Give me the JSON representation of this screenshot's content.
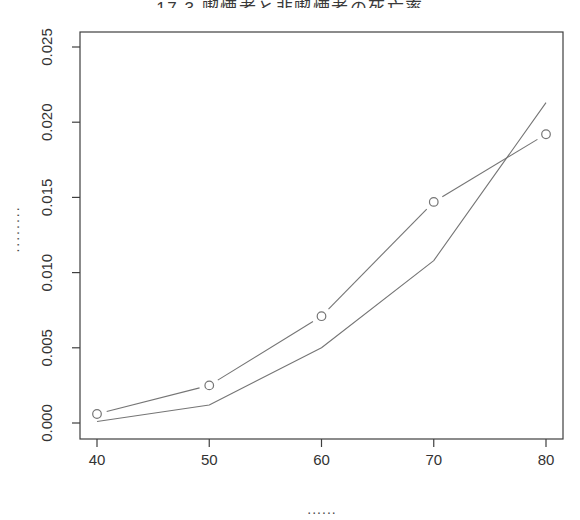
{
  "window": {
    "width": 580,
    "height": 520
  },
  "chart_data": {
    "type": "line",
    "title": "17.3 喫煙者と非喫煙者の死亡率",
    "title_visible_note": "clipped at top edge of screenshot",
    "xlabel": "......",
    "ylabel": "........",
    "x": [
      40,
      50,
      60,
      70,
      80
    ],
    "series": [
      {
        "name": "line-with-circle-markers",
        "marker": "open-circle",
        "values": [
          0.0006,
          0.0025,
          0.0071,
          0.0147,
          0.0192
        ]
      },
      {
        "name": "plain-line",
        "marker": "none",
        "values": [
          0.0001,
          0.0012,
          0.005,
          0.0108,
          0.0213
        ]
      }
    ],
    "xticks": [
      "40",
      "50",
      "60",
      "70",
      "80"
    ],
    "yticks": [
      "0.000",
      "0.005",
      "0.010",
      "0.015",
      "0.020",
      "0.025"
    ],
    "xlim": [
      38.6,
      81.5
    ],
    "ylim": [
      -0.001,
      0.026
    ],
    "grid": false,
    "legend": null
  },
  "colors": {
    "background": "#ffffff",
    "axis": "#3f3f3f",
    "tick_text": "#333333",
    "line": "#757575",
    "marker": "#757575",
    "label_dots": "#4a4a4a"
  }
}
